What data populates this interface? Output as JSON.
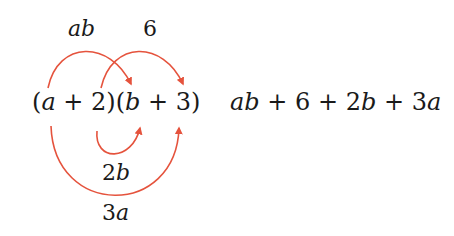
{
  "diagram": {
    "arrow_color": "#e5533d",
    "text_color": "#1a1a1a",
    "product": {
      "open1": "(",
      "var1": "a",
      "op1": " + 2)(",
      "var2": "b",
      "op2": " + 3)"
    },
    "result": {
      "t1": "ab",
      "p1": " + 6 + 2",
      "t3var": "b",
      "p2": " + 3",
      "t4var": "a"
    },
    "labels": {
      "first": "ab",
      "last": "6",
      "inner_coef": "2",
      "inner_var": "b",
      "outer_coef": "3",
      "outer_var": "a"
    }
  }
}
